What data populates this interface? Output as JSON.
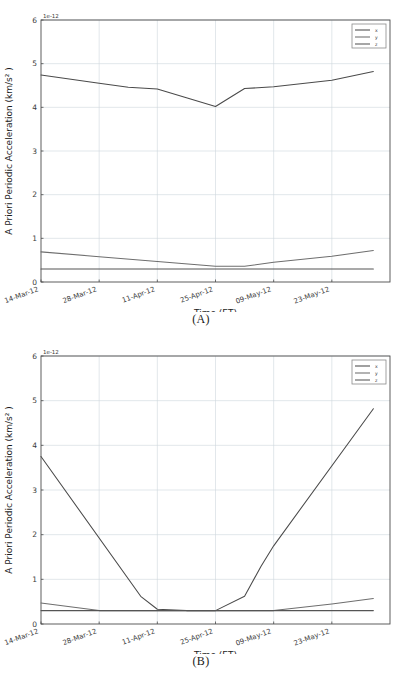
{
  "figure": {
    "panels": [
      {
        "id": "A",
        "caption": "(A)",
        "xlabel": "Time (ET)",
        "ylabel": "A Priori Periodic Acceleration (km/s² )",
        "exponent": "1e−12"
      },
      {
        "id": "B",
        "caption": "(B)",
        "xlabel": "Time (ET)",
        "ylabel": "A Priori Periodic Acceleration (km/s² )",
        "exponent": "1e−12"
      }
    ]
  },
  "colors": {
    "series_x": "#4a4a4a",
    "series_y": "#6e6e6e",
    "series_z": "#555555",
    "grid": "#cfd6dd",
    "axis": "#4d4d4d",
    "text": "#2b2b2b",
    "background": "#ffffff"
  },
  "chart_data": [
    {
      "type": "line",
      "title": "(A)",
      "xlabel": "Time (ET)",
      "ylabel": "A Priori Periodic Acceleration (km/s² )",
      "y_exponent": "1e-12",
      "xlim": [
        0,
        84
      ],
      "ylim": [
        0,
        6
      ],
      "yticks": [
        0,
        1,
        2,
        3,
        4,
        5,
        6
      ],
      "ytick_labels": [
        "0",
        "1",
        "2",
        "3",
        "4",
        "5",
        "6"
      ],
      "xticks": [
        0,
        14,
        28,
        42,
        56,
        70
      ],
      "xtick_labels": [
        "14-Mar-12",
        "28-Mar-12",
        "11-Apr-12",
        "25-Apr-12",
        "09-May-12",
        "23-May-12"
      ],
      "grid": true,
      "legend": [
        "x",
        "y",
        "z"
      ],
      "legend_position": "upper right",
      "series": [
        {
          "name": "x",
          "x": [
            0,
            14,
            21,
            28,
            35,
            42,
            49,
            56,
            70,
            80
          ],
          "values": [
            4.74,
            4.55,
            4.46,
            4.42,
            4.22,
            4.02,
            4.43,
            4.47,
            4.62,
            4.82
          ]
        },
        {
          "name": "y",
          "x": [
            0,
            14,
            28,
            42,
            49,
            56,
            70,
            80
          ],
          "values": [
            0.69,
            0.58,
            0.47,
            0.36,
            0.36,
            0.45,
            0.59,
            0.72
          ]
        },
        {
          "name": "z",
          "x": [
            0,
            80
          ],
          "values": [
            0.3,
            0.3
          ]
        }
      ]
    },
    {
      "type": "line",
      "title": "(B)",
      "xlabel": "Time (ET)",
      "ylabel": "A Priori Periodic Acceleration (km/s² )",
      "y_exponent": "1e-12",
      "xlim": [
        0,
        84
      ],
      "ylim": [
        0,
        6
      ],
      "yticks": [
        0,
        1,
        2,
        3,
        4,
        5,
        6
      ],
      "ytick_labels": [
        "0",
        "1",
        "2",
        "3",
        "4",
        "5",
        "6"
      ],
      "xticks": [
        0,
        14,
        28,
        42,
        56,
        70
      ],
      "xtick_labels": [
        "14-Mar-12",
        "28-Mar-12",
        "11-Apr-12",
        "25-Apr-12",
        "09-May-12",
        "23-May-12"
      ],
      "grid": true,
      "legend": [
        "x",
        "y",
        "z"
      ],
      "legend_position": "upper right",
      "series": [
        {
          "name": "x",
          "x": [
            0,
            24,
            28,
            35,
            42,
            49,
            53,
            56,
            80
          ],
          "values": [
            3.75,
            0.62,
            0.33,
            0.3,
            0.3,
            0.62,
            1.3,
            1.75,
            4.82
          ]
        },
        {
          "name": "y",
          "x": [
            0,
            14,
            28,
            42,
            56,
            70,
            80
          ],
          "values": [
            0.47,
            0.3,
            0.3,
            0.3,
            0.3,
            0.45,
            0.57
          ]
        },
        {
          "name": "z",
          "x": [
            0,
            80
          ],
          "values": [
            0.3,
            0.3
          ]
        }
      ]
    }
  ]
}
